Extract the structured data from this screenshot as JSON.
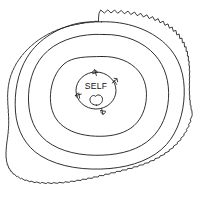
{
  "diagram": {
    "type": "concentric-contour-diagram",
    "title": "",
    "background_color": "#ffffff",
    "line_color": "#1a1a1a",
    "center_label": "SELF",
    "center_symbol": "heart-blob",
    "ring_count": 4,
    "outer_ring_style": "serrated",
    "inner_ring_style": "smooth",
    "rings": [
      {
        "name": "outer-boundary",
        "index": 1,
        "style": "serrated"
      },
      {
        "name": "contour-ring-2",
        "index": 2,
        "style": "smooth"
      },
      {
        "name": "contour-ring-3",
        "index": 3,
        "style": "smooth"
      },
      {
        "name": "contour-ring-4",
        "index": 4,
        "style": "smooth"
      },
      {
        "name": "self-circle",
        "index": 5,
        "style": "circle"
      }
    ],
    "arrows": [
      {
        "name": "arrow-top",
        "direction": "inward",
        "position": "top"
      },
      {
        "name": "arrow-upper-right",
        "direction": "inward",
        "position": "upper-right"
      },
      {
        "name": "arrow-left",
        "direction": "inward",
        "position": "left"
      },
      {
        "name": "arrow-bottom",
        "direction": "inward",
        "position": "bottom"
      }
    ]
  }
}
